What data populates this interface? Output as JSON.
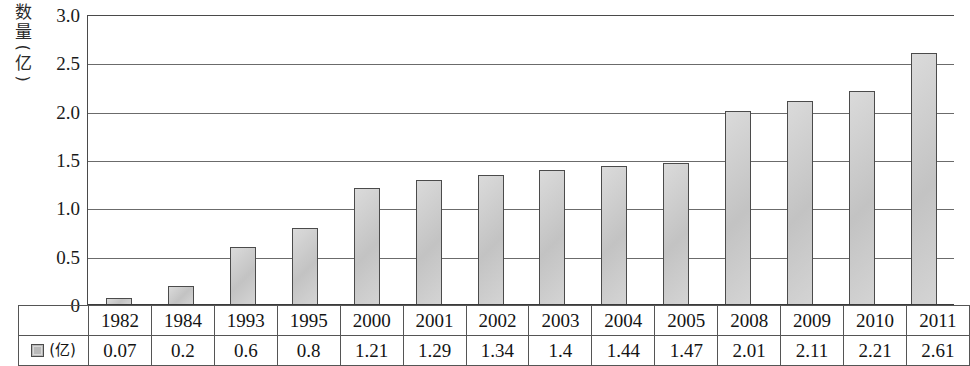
{
  "chart_data": {
    "type": "bar",
    "title": "",
    "xlabel": "",
    "ylabel": "数量(亿)",
    "ylim": [
      0,
      3.0
    ],
    "yticks": [
      "0",
      "0.5",
      "1.0",
      "1.5",
      "2.0",
      "2.5",
      "3.0"
    ],
    "ytick_values": [
      0,
      0.5,
      1.0,
      1.5,
      2.0,
      2.5,
      3.0
    ],
    "grid": true,
    "legend_position": "bottom-left-table",
    "categories": [
      "1982",
      "1984",
      "1993",
      "1995",
      "2000",
      "2001",
      "2002",
      "2003",
      "2004",
      "2005",
      "2008",
      "2009",
      "2010",
      "2011"
    ],
    "values": [
      0.07,
      0.2,
      0.6,
      0.8,
      1.21,
      1.29,
      1.34,
      1.4,
      1.44,
      1.47,
      2.01,
      2.11,
      2.21,
      2.61
    ],
    "value_labels": [
      "0.07",
      "0.2",
      "0.6",
      "0.8",
      "1.21",
      "1.29",
      "1.34",
      "1.4",
      "1.44",
      "1.47",
      "2.01",
      "2.11",
      "2.21",
      "2.61"
    ],
    "series": [
      {
        "name": "(亿)",
        "values": [
          0.07,
          0.2,
          0.6,
          0.8,
          1.21,
          1.29,
          1.34,
          1.4,
          1.44,
          1.47,
          2.01,
          2.11,
          2.21,
          2.61
        ]
      }
    ]
  },
  "axis": {
    "y_title_chars": [
      "数",
      "量"
    ],
    "y_title_paren_open": "(",
    "y_title_unit": "亿",
    "y_title_paren_close": ")",
    "y_title_full": "数量(亿)"
  },
  "legend": {
    "swatch_name": "gray-square-swatch",
    "label": "(亿)"
  },
  "colors": {
    "bar_fill": "#c9c9c9",
    "bar_border": "#4b4b4b",
    "gridline": "#6b6b6b",
    "axis": "#3a3a3a",
    "table_border": "#555555",
    "text": "#141414",
    "background": "#ffffff"
  }
}
